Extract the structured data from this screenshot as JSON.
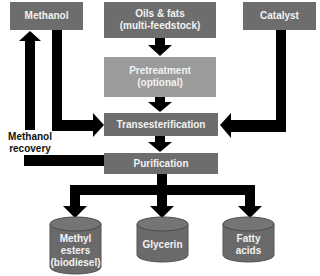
{
  "diagram": {
    "inputs": {
      "methanol": "Methanol",
      "oils_line1": "Oils & fats",
      "oils_line2": "(multi-feedstock)",
      "catalyst": "Catalyst"
    },
    "steps": {
      "pretreatment_line1": "Pretreatment",
      "pretreatment_line2": "(optional)",
      "transesterification": "Transesterification",
      "purification": "Purification"
    },
    "recovery": {
      "line1": "Methanol",
      "line2": "recovery"
    },
    "outputs": [
      {
        "line1": "Methyl",
        "line2": "esters",
        "line3": "(biodiesel)"
      },
      {
        "line1": "Glycerin"
      },
      {
        "line1": "Fatty",
        "line2": "acids"
      }
    ],
    "colors": {
      "box_dark": "#6d6d6d",
      "box_light": "#9b9b9b",
      "arrow": "#000000",
      "text": "#f2f2f2"
    }
  }
}
